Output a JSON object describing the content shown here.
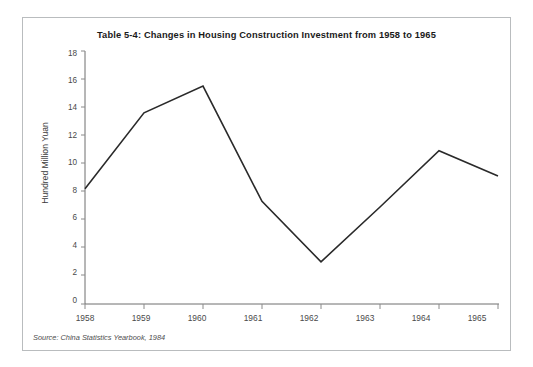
{
  "figure": {
    "title": "Table 5-4: Changes in Housing Construction Investment from 1958 to 1965",
    "source_note": "Source: China Statistics Yearbook, 1984",
    "border_color": "#b9bcbe",
    "background_color": "#ffffff",
    "line_color": "#2a2a2a",
    "axis_color": "#6f6f6f"
  },
  "chart_data": {
    "type": "line",
    "title": "Table 5-4: Changes in Housing Construction Investment from 1958 to 1965",
    "xlabel": "",
    "ylabel": "Hundred Million Yuan",
    "categories": [
      "1958",
      "1959",
      "1960",
      "1961",
      "1962",
      "1963",
      "1964",
      "1965"
    ],
    "x": [
      1958,
      1959,
      1960,
      1961,
      1962,
      1963,
      1964,
      1965
    ],
    "values": [
      8.2,
      13.6,
      15.5,
      7.3,
      3.0,
      6.9,
      10.9,
      9.1
    ],
    "series": [
      {
        "name": "Housing Construction Investment",
        "values": [
          8.2,
          13.6,
          15.5,
          7.3,
          3.0,
          6.9,
          10.9,
          9.1
        ]
      }
    ],
    "ylim": [
      0,
      18
    ],
    "yticks": [
      0,
      2,
      4,
      6,
      8,
      10,
      12,
      14,
      16,
      18
    ],
    "ytick_labels": [
      "0",
      "2",
      "4",
      "6",
      "8",
      "10",
      "12",
      "14",
      "16",
      "18"
    ],
    "xtick_labels": [
      "1958",
      "1959",
      "1960",
      "1961",
      "1962",
      "1963",
      "1964",
      "1965"
    ],
    "grid": false,
    "legend": null,
    "annotations": [
      "Source: China Statistics Yearbook, 1984"
    ]
  }
}
